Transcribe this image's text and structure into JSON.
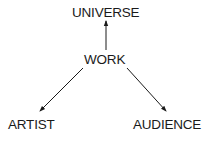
{
  "diagram": {
    "nodes": [
      {
        "id": "universe",
        "label": "UNIVERSE"
      },
      {
        "id": "work",
        "label": "WORK"
      },
      {
        "id": "artist",
        "label": "ARTIST"
      },
      {
        "id": "audience",
        "label": "AUDIENCE"
      }
    ],
    "edges": [
      {
        "from": "work",
        "to": "universe"
      },
      {
        "from": "work",
        "to": "artist"
      },
      {
        "from": "work",
        "to": "audience"
      }
    ],
    "colors": {
      "text": "#1a1a1a",
      "line": "#1a1a1a",
      "background": "#ffffff"
    }
  }
}
